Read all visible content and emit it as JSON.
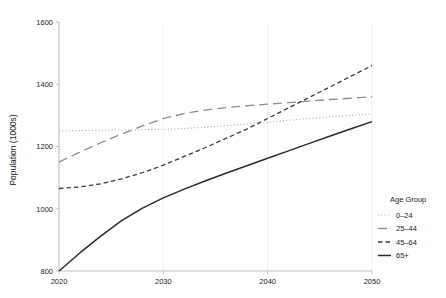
{
  "chart_data": {
    "type": "line",
    "title": "",
    "xlabel": "",
    "ylabel": "Population (1000s)",
    "xlim": [
      2020,
      2050
    ],
    "ylim": [
      800,
      1600
    ],
    "xticks": [
      2020,
      2030,
      2040,
      2050
    ],
    "yticks": [
      800,
      1000,
      1200,
      1400,
      1600
    ],
    "grid": "vertical-only",
    "legend_position": "right",
    "legend_title": "Age Group",
    "x": [
      2020,
      2022,
      2024,
      2026,
      2028,
      2030,
      2032,
      2034,
      2036,
      2038,
      2040,
      2042,
      2044,
      2046,
      2048,
      2050
    ],
    "series": [
      {
        "name": "0–24",
        "linestyle": "dotted",
        "color": "#9a9a9a",
        "values": [
          1250,
          1251,
          1252,
          1253,
          1254,
          1255,
          1258,
          1262,
          1267,
          1272,
          1278,
          1284,
          1290,
          1295,
          1300,
          1305
        ]
      },
      {
        "name": "25–44",
        "linestyle": "long-dash",
        "color": "#8c8c8c",
        "values": [
          1150,
          1182,
          1212,
          1240,
          1266,
          1290,
          1306,
          1317,
          1325,
          1331,
          1336,
          1341,
          1346,
          1351,
          1355,
          1360
        ]
      },
      {
        "name": "45–64",
        "linestyle": "dash",
        "color": "#3a3a3a",
        "values": [
          1065,
          1070,
          1080,
          1096,
          1116,
          1140,
          1168,
          1196,
          1226,
          1256,
          1290,
          1324,
          1358,
          1392,
          1426,
          1460
        ]
      },
      {
        "name": "65+",
        "linestyle": "solid",
        "color": "#2a2a2a",
        "values": [
          800,
          858,
          912,
          962,
          1002,
          1035,
          1063,
          1089,
          1114,
          1138,
          1162,
          1186,
          1210,
          1234,
          1257,
          1280
        ]
      }
    ]
  }
}
